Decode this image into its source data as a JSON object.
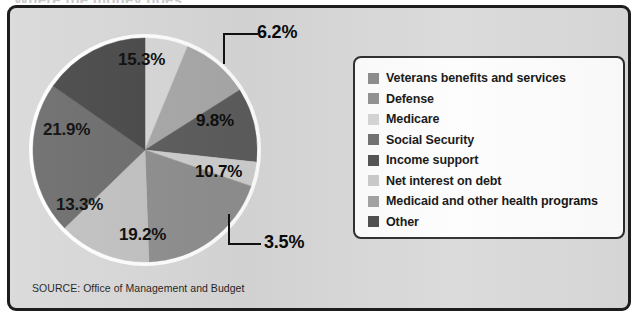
{
  "figure": {
    "title_bleed": "Where the money goes",
    "source": "SOURCE: Office of Management and Budget",
    "panel_bg": "#d9d9d9",
    "panel_border": "#1d1d1d"
  },
  "chart_data": {
    "type": "pie",
    "title": "",
    "xlabel": "",
    "ylabel": "",
    "legend_position": "right",
    "grid": false,
    "units": "percent",
    "start_angle_deg": 0,
    "direction": "clockwise",
    "categories": [
      "Net interest on debt",
      "Medicaid and other health programs",
      "Income support",
      "Veterans benefits and services",
      "Defense",
      "Medicare",
      "Social Security",
      "Other"
    ],
    "values": [
      6.2,
      9.8,
      10.7,
      3.5,
      19.2,
      13.3,
      21.9,
      15.3
    ],
    "labels": [
      "6.2%",
      "9.8%",
      "10.7%",
      "3.5%",
      "19.2%",
      "13.3%",
      "21.9%",
      "15.3%"
    ],
    "colors": [
      "#d8d8d8",
      "#a9a9a9",
      "#5d5d5d",
      "#cfcfcf",
      "#8f8f8f",
      "#c2c2c2",
      "#6e6e6e",
      "#4a4a4a"
    ],
    "slices": [
      {
        "label": "6.2%",
        "value": 6.2,
        "legend": "Net interest on debt",
        "color": "#d8d8d8",
        "callout": true
      },
      {
        "label": "9.8%",
        "value": 9.8,
        "legend": "Medicaid and other health programs",
        "color": "#a9a9a9",
        "callout": false
      },
      {
        "label": "10.7%",
        "value": 10.7,
        "legend": "Income support",
        "color": "#5d5d5d",
        "callout": false
      },
      {
        "label": "3.5%",
        "value": 3.5,
        "legend": "Veterans benefits and services",
        "color": "#cfcfcf",
        "callout": true
      },
      {
        "label": "19.2%",
        "value": 19.2,
        "legend": "Defense",
        "color": "#8f8f8f",
        "callout": false
      },
      {
        "label": "13.3%",
        "value": 13.3,
        "legend": "Medicare",
        "color": "#c2c2c2",
        "callout": false
      },
      {
        "label": "21.9%",
        "value": 21.9,
        "legend": "Social Security",
        "color": "#6e6e6e",
        "callout": false
      },
      {
        "label": "15.3%",
        "value": 15.3,
        "legend": "Other",
        "color": "#4a4a4a",
        "callout": false
      }
    ]
  },
  "legend": {
    "items": [
      {
        "label": "Veterans benefits and services",
        "color": "#8a8a8a"
      },
      {
        "label": "Defense",
        "color": "#8f8f8f"
      },
      {
        "label": "Medicare",
        "color": "#d4d4d4"
      },
      {
        "label": "Social Security",
        "color": "#6e6e6e"
      },
      {
        "label": "Income support",
        "color": "#4f4f4f"
      },
      {
        "label": "Net interest on debt",
        "color": "#c9c9c9"
      },
      {
        "label": "Medicaid and other health programs",
        "color": "#a0a0a0"
      },
      {
        "label": "Other",
        "color": "#4a4a4a"
      }
    ]
  }
}
